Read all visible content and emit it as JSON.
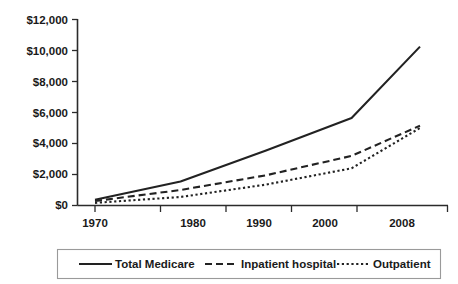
{
  "chart_data": {
    "type": "line",
    "title": "",
    "subtitle": "",
    "xlabel": "",
    "ylabel": "",
    "x": [
      1970,
      1980,
      1990,
      2000,
      2008
    ],
    "categories": [
      "1970",
      "1980",
      "1990",
      "2000",
      "2008"
    ],
    "xtick_labels": [
      "1970",
      "1980",
      "1990",
      "2000",
      "2008"
    ],
    "ytick_labels": [
      "$0",
      "$2,000",
      "$4,000",
      "$6,000",
      "$8,000",
      "$10,000",
      "$12,000"
    ],
    "ytick_values": [
      0,
      2000,
      4000,
      6000,
      8000,
      10000,
      12000
    ],
    "ylim": [
      0,
      12000
    ],
    "xlim": [
      1970,
      2008
    ],
    "grid": false,
    "legend_position": "bottom",
    "series": [
      {
        "name": "Total Medicare",
        "style": "solid",
        "values": [
          370,
          1550,
          3550,
          5650,
          10250
        ]
      },
      {
        "name": "Inpatient hospital",
        "style": "dashed",
        "values": [
          290,
          1000,
          1950,
          3200,
          5150
        ]
      },
      {
        "name": "Outpatient",
        "style": "dotted",
        "values": [
          170,
          550,
          1350,
          2400,
          5000
        ]
      }
    ]
  },
  "axes": {
    "y_axis_name": "dollars-axis",
    "x_axis_name": "year-axis"
  },
  "legend": {
    "entries": [
      {
        "label": "Total Medicare",
        "style": "solid"
      },
      {
        "label": "Inpatient hospital",
        "style": "dashed"
      },
      {
        "label": "Outpatient",
        "style": "dotted"
      }
    ]
  },
  "colors": {
    "line": "#222222",
    "axis": "#2b2b2b",
    "legend_border": "#9a9a9a",
    "background": "#ffffff",
    "text": "#1a1a1a"
  }
}
